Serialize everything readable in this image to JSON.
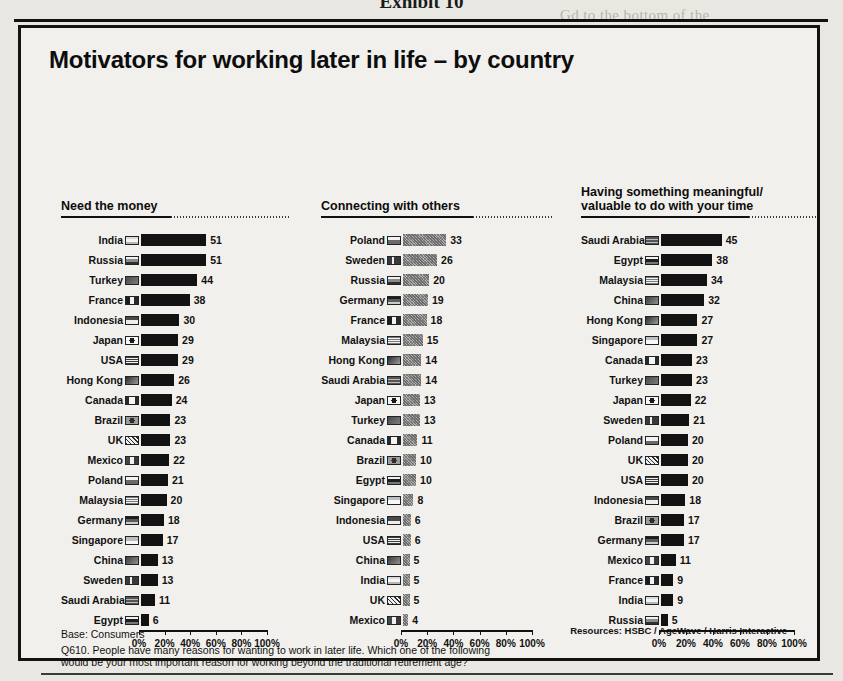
{
  "exhibit_label": "Exhibit 10",
  "title": "Motivators for working later in life – by country",
  "footer": {
    "base": "Base: Consumers",
    "question_line1": "Q610. People have many reasons for wanting to work in later life. Which one of the following",
    "question_line2": "would be your most important reason for working beyond the traditional retirement age?",
    "resources": "Resources:  HSBC / AgeWave / Harris Interactive"
  },
  "axis": {
    "ticks": [
      "0%",
      "20%",
      "40%",
      "60%",
      "80%",
      "100%"
    ],
    "min": 0,
    "max": 100
  },
  "bleed_text": [
    {
      "x": 560,
      "y": 2,
      "t": "Gd to the bottom of the"
    },
    {
      "x": 556,
      "y": 78,
      "t": "and responsibility, an in-"
    },
    {
      "x": 556,
      "y": 104,
      "t": "ty. Over 80 percent"
    },
    {
      "x": 556,
      "y": 130,
      "t": "t and work-family bal-"
    },
    {
      "x": 560,
      "y": 330,
      "t": "employment"
    },
    {
      "x": 556,
      "y": 380,
      "t": "provides retirees with"
    },
    {
      "x": 556,
      "y": 406,
      "t": "etirement planning and"
    },
    {
      "x": 556,
      "y": 432,
      "t": "ased earnings"
    },
    {
      "x": 556,
      "y": 480,
      "t": "ple who are working"
    },
    {
      "x": 556,
      "y": 506,
      "t": "alued, and stimulated"
    },
    {
      "x": 556,
      "y": 532,
      "t": "nt. Working longer also"
    }
  ],
  "charts": [
    {
      "type": "bar",
      "title": "Need the money",
      "orientation": "horizontal",
      "bar_style": "black",
      "xlabel": "",
      "ylabel": "",
      "xlim": [
        0,
        100
      ],
      "categories": [
        "India",
        "Russia",
        "Turkey",
        "France",
        "Indonesia",
        "Japan",
        "USA",
        "Hong Kong",
        "Canada",
        "Brazil",
        "UK",
        "Mexico",
        "Poland",
        "Malaysia",
        "Germany",
        "Singapore",
        "China",
        "Sweden",
        "Saudi Arabia",
        "Egypt"
      ],
      "values": [
        51,
        51,
        44,
        38,
        30,
        29,
        29,
        26,
        24,
        23,
        23,
        22,
        21,
        20,
        18,
        17,
        13,
        13,
        11,
        6
      ]
    },
    {
      "type": "bar",
      "title": "Connecting with others",
      "orientation": "horizontal",
      "bar_style": "gray",
      "xlabel": "",
      "ylabel": "",
      "xlim": [
        0,
        100
      ],
      "categories": [
        "Poland",
        "Sweden",
        "Russia",
        "Germany",
        "France",
        "Malaysia",
        "Hong Kong",
        "Saudi Arabia",
        "Japan",
        "Turkey",
        "Canada",
        "Brazil",
        "Egypt",
        "Singapore",
        "Indonesia",
        "USA",
        "China",
        "India",
        "UK",
        "Mexico"
      ],
      "values": [
        33,
        26,
        20,
        19,
        18,
        15,
        14,
        14,
        13,
        13,
        11,
        10,
        10,
        8,
        6,
        6,
        5,
        5,
        5,
        4
      ]
    },
    {
      "type": "bar",
      "title": "Having something meaningful/ valuable to do with your time",
      "title_line1": "Having something meaningful/",
      "title_line2": "valuable to do with your time",
      "orientation": "horizontal",
      "bar_style": "black",
      "xlabel": "",
      "ylabel": "",
      "xlim": [
        0,
        100
      ],
      "categories": [
        "Saudi Arabia",
        "Egypt",
        "Malaysia",
        "China",
        "Hong Kong",
        "Singapore",
        "Canada",
        "Turkey",
        "Japan",
        "Sweden",
        "Poland",
        "UK",
        "USA",
        "Indonesia",
        "Brazil",
        "Germany",
        "Mexico",
        "France",
        "India",
        "Russia"
      ],
      "values": [
        45,
        38,
        34,
        32,
        27,
        27,
        23,
        23,
        22,
        21,
        20,
        20,
        20,
        18,
        17,
        17,
        11,
        9,
        9,
        5
      ]
    }
  ],
  "chart_data": {
    "type": "bar",
    "title": "Motivators for working later in life – by country",
    "xlabel": "Percent of consumers",
    "ylabel": "Country",
    "xlim": [
      0,
      100
    ],
    "panels": [
      {
        "name": "Need the money",
        "categories": [
          "India",
          "Russia",
          "Turkey",
          "France",
          "Indonesia",
          "Japan",
          "USA",
          "Hong Kong",
          "Canada",
          "Brazil",
          "UK",
          "Mexico",
          "Poland",
          "Malaysia",
          "Germany",
          "Singapore",
          "China",
          "Sweden",
          "Saudi Arabia",
          "Egypt"
        ],
        "values": [
          51,
          51,
          44,
          38,
          30,
          29,
          29,
          26,
          24,
          23,
          23,
          22,
          21,
          20,
          18,
          17,
          13,
          13,
          11,
          6
        ]
      },
      {
        "name": "Connecting with others",
        "categories": [
          "Poland",
          "Sweden",
          "Russia",
          "Germany",
          "France",
          "Malaysia",
          "Hong Kong",
          "Saudi Arabia",
          "Japan",
          "Turkey",
          "Canada",
          "Brazil",
          "Egypt",
          "Singapore",
          "Indonesia",
          "USA",
          "China",
          "India",
          "UK",
          "Mexico"
        ],
        "values": [
          33,
          26,
          20,
          19,
          18,
          15,
          14,
          14,
          13,
          13,
          11,
          10,
          10,
          8,
          6,
          6,
          5,
          5,
          5,
          4
        ]
      },
      {
        "name": "Having something meaningful/valuable to do with your time",
        "categories": [
          "Saudi Arabia",
          "Egypt",
          "Malaysia",
          "China",
          "Hong Kong",
          "Singapore",
          "Canada",
          "Turkey",
          "Japan",
          "Sweden",
          "Poland",
          "UK",
          "USA",
          "Indonesia",
          "Brazil",
          "Germany",
          "Mexico",
          "France",
          "India",
          "Russia"
        ],
        "values": [
          45,
          38,
          34,
          32,
          27,
          27,
          23,
          23,
          22,
          21,
          20,
          20,
          20,
          18,
          17,
          17,
          11,
          9,
          9,
          5
        ]
      }
    ],
    "grid": false,
    "legend": "none"
  }
}
